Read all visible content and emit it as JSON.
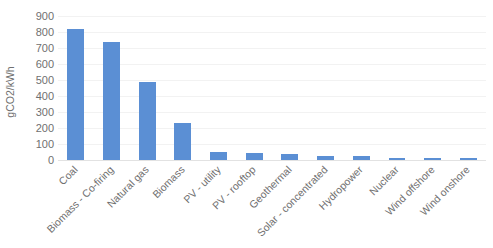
{
  "chart_data": {
    "type": "bar",
    "title": "",
    "subtitle": "",
    "xlabel": "",
    "ylabel": "gCO2/kWh",
    "ylim": [
      0,
      900
    ],
    "ytick_step": 100,
    "yticks": [
      900,
      800,
      700,
      600,
      500,
      400,
      300,
      200,
      100,
      0
    ],
    "ytick_labels": [
      "900",
      "800",
      "700",
      "600",
      "500",
      "400",
      "300",
      "200",
      "100",
      "0"
    ],
    "grid": true,
    "grid_axis": "y",
    "legend": false,
    "legend_position": "none",
    "bar_color": "#5B8FD4",
    "categories": [
      "Coal",
      "Biomass - Co-firing",
      "Natural gas",
      "Biomass",
      "PV - utility",
      "PV - rooftop",
      "Geothermal",
      "Solar - concentrated",
      "Hydropower",
      "Nuclear",
      "Wind offshore",
      "Wind onshore"
    ],
    "values": [
      820,
      740,
      490,
      230,
      48,
      41,
      38,
      27,
      24,
      12,
      12,
      11
    ],
    "series": [
      {
        "name": "gCO2/kWh",
        "values": [
          820,
          740,
          490,
          230,
          48,
          41,
          38,
          27,
          24,
          12,
          12,
          11
        ]
      }
    ]
  },
  "axes": {
    "y_title": "gCO2/kWh"
  },
  "footer": {
    "mark": ""
  }
}
